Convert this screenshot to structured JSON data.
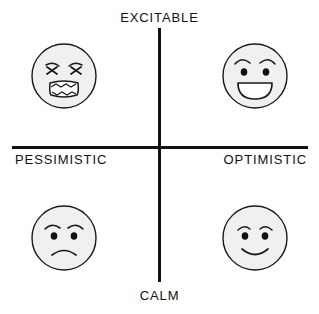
{
  "diagram": {
    "axes": {
      "vertical": {
        "top_label": "EXCITABLE",
        "bottom_label": "CALM"
      },
      "horizontal": {
        "left_label": "PESSIMISTIC",
        "right_label": "OPTIMISTIC"
      }
    },
    "colors": {
      "line": "#111111",
      "face_fill": "#f0f0f0",
      "face_stroke": "#1a1a1a",
      "background": "#ffffff"
    },
    "quadrants": [
      {
        "position": "top-left",
        "emotion": "angry",
        "icon": "angry-face-icon",
        "axis_combination": "excitable + pessimistic"
      },
      {
        "position": "top-right",
        "emotion": "happy",
        "icon": "happy-face-icon",
        "axis_combination": "excitable + optimistic"
      },
      {
        "position": "bottom-left",
        "emotion": "sad",
        "icon": "sad-face-icon",
        "axis_combination": "calm + pessimistic"
      },
      {
        "position": "bottom-right",
        "emotion": "content",
        "icon": "content-face-icon",
        "axis_combination": "calm + optimistic"
      }
    ]
  }
}
